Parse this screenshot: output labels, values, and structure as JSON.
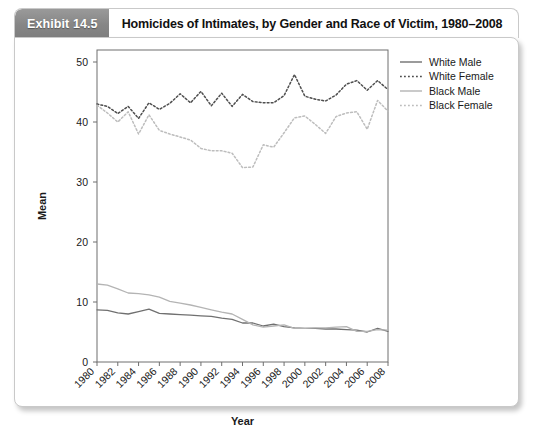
{
  "exhibit": {
    "badge_label": "Exhibit 14.5",
    "title": "Homicides of Intimates, by Gender and Race of Victim, 1980–2008"
  },
  "chart_data": {
    "type": "line",
    "title": "",
    "xlabel": "Year",
    "ylabel": "Mean",
    "xlim": [
      1980,
      2008
    ],
    "ylim": [
      0,
      52
    ],
    "yticks": [
      0,
      10,
      20,
      30,
      40,
      50
    ],
    "xticks": [
      1980,
      1982,
      1984,
      1986,
      1988,
      1990,
      1992,
      1994,
      1996,
      1998,
      2000,
      2002,
      2004,
      2006,
      2008
    ],
    "xtick_rotation_deg": 45,
    "grid": false,
    "legend_position": "right",
    "x": [
      1980,
      1981,
      1982,
      1983,
      1984,
      1985,
      1986,
      1987,
      1988,
      1989,
      1990,
      1991,
      1992,
      1993,
      1994,
      1995,
      1996,
      1997,
      1998,
      1999,
      2000,
      2001,
      2002,
      2003,
      2004,
      2005,
      2006,
      2007,
      2008
    ],
    "series": [
      {
        "name": "White Male",
        "color": "#707070",
        "style": "solid",
        "values": [
          8.7,
          8.6,
          8.2,
          8.0,
          8.4,
          8.8,
          8.1,
          8.0,
          7.9,
          7.8,
          7.7,
          7.6,
          7.3,
          7.1,
          6.5,
          6.5,
          6.0,
          6.3,
          5.9,
          5.7,
          5.6,
          5.6,
          5.5,
          5.5,
          5.4,
          5.3,
          5.0,
          5.6,
          5.1
        ]
      },
      {
        "name": "White Female",
        "color": "#4e4e4e",
        "style": "dotted",
        "values": [
          43.0,
          42.6,
          41.4,
          42.6,
          40.6,
          43.2,
          42.1,
          43.1,
          44.7,
          43.2,
          45.1,
          42.7,
          44.8,
          42.6,
          44.6,
          43.4,
          43.2,
          43.2,
          44.4,
          47.9,
          44.3,
          43.8,
          43.5,
          44.5,
          46.3,
          46.9,
          45.3,
          46.9,
          45.4
        ]
      },
      {
        "name": "Black Male",
        "color": "#b4b4b4",
        "style": "solid",
        "values": [
          13.0,
          12.8,
          12.2,
          11.5,
          11.4,
          11.2,
          10.8,
          10.1,
          9.8,
          9.5,
          9.1,
          8.7,
          8.3,
          8.0,
          7.1,
          6.2,
          5.8,
          6.0,
          6.2,
          5.6,
          5.6,
          5.7,
          5.7,
          5.8,
          5.9,
          5.1,
          5.1,
          5.4,
          5.3
        ]
      },
      {
        "name": "Black Female",
        "color": "#bdbdbd",
        "style": "dotted",
        "values": [
          42.8,
          41.5,
          40.0,
          41.7,
          38.0,
          41.2,
          38.6,
          38.0,
          37.5,
          37.0,
          35.6,
          35.2,
          35.2,
          34.8,
          32.4,
          32.5,
          36.2,
          35.8,
          38.2,
          40.7,
          41.0,
          39.6,
          38.1,
          40.9,
          41.5,
          41.7,
          38.8,
          43.6,
          41.8
        ]
      }
    ]
  }
}
